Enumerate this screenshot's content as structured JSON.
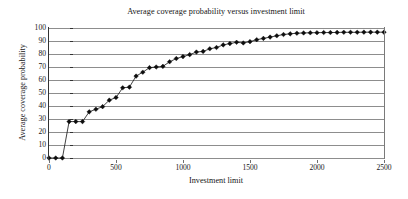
{
  "chart_data": {
    "type": "line",
    "title": "Average coverage probability versus investment limit",
    "xlabel": "Investment limit",
    "ylabel": "Average coverage probability",
    "grid": true,
    "legend": false,
    "marker": "diamond",
    "xlim": [
      0,
      2500
    ],
    "ylim": [
      0,
      100
    ],
    "xticks": [
      0,
      500,
      1000,
      1500,
      2000,
      2500
    ],
    "yticks": [
      0,
      10,
      20,
      30,
      40,
      50,
      60,
      70,
      80,
      90,
      100
    ],
    "series": [
      {
        "name": "Average coverage probability",
        "x": [
          0,
          50,
          100,
          150,
          200,
          250,
          300,
          350,
          400,
          450,
          500,
          550,
          600,
          650,
          700,
          750,
          800,
          850,
          900,
          950,
          1000,
          1050,
          1100,
          1150,
          1200,
          1250,
          1300,
          1350,
          1400,
          1450,
          1500,
          1550,
          1600,
          1650,
          1700,
          1750,
          1800,
          1850,
          1900,
          1950,
          2000,
          2050,
          2100,
          2150,
          2200,
          2250,
          2300,
          2350,
          2400,
          2450,
          2500
        ],
        "values": [
          0,
          0,
          0,
          28,
          28,
          28,
          35.5,
          37.5,
          39.5,
          44.5,
          46.5,
          54,
          54.5,
          63,
          66,
          69.5,
          70,
          70.5,
          74,
          76.5,
          78,
          79.5,
          81.5,
          82,
          84,
          85,
          87,
          88,
          89,
          88.5,
          89.5,
          91,
          92,
          93,
          94,
          95,
          95.5,
          96,
          96.2,
          96.3,
          96.4,
          96.5,
          96.5,
          96.6,
          96.7,
          96.7,
          96.7,
          96.8,
          96.8,
          96.8,
          96.8
        ]
      }
    ]
  },
  "colors": {
    "marker": "#0d0d0d",
    "line": "#111111",
    "grid": "#8d8d8d",
    "axis": "#333333",
    "text": "#151515",
    "background": "#ffffff"
  }
}
